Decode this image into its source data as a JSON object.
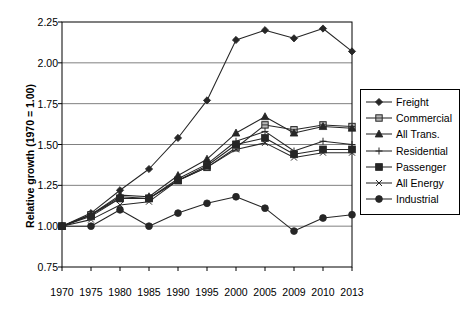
{
  "chart_data": {
    "type": "line",
    "title": "",
    "xlabel": "",
    "ylabel": "Relative growth (1970 = 1.00)",
    "categories": [
      "1970",
      "1975",
      "1980",
      "1985",
      "1990",
      "1995",
      "2000",
      "2005",
      "2009",
      "2010",
      "2013"
    ],
    "x": [
      1970,
      1975,
      1980,
      1985,
      1990,
      1995,
      2000,
      2005,
      2009,
      2010,
      2013
    ],
    "ylim": [
      0.75,
      2.25
    ],
    "yticks": [
      "0.75",
      "1.00",
      "1.25",
      "1.50",
      "1.75",
      "2.00",
      "2.25"
    ],
    "ytick_values": [
      0.75,
      1.0,
      1.25,
      1.5,
      1.75,
      2.0,
      2.25
    ],
    "grid": true,
    "legend_position": "right",
    "series": [
      {
        "name": "Freight",
        "marker": "diamond",
        "values": [
          1.0,
          1.08,
          1.22,
          1.35,
          1.54,
          1.77,
          2.14,
          2.2,
          2.15,
          2.21,
          2.07
        ]
      },
      {
        "name": "Commercial",
        "marker": "square-hatched",
        "values": [
          1.0,
          1.07,
          1.17,
          1.17,
          1.28,
          1.36,
          1.48,
          1.62,
          1.59,
          1.62,
          1.61
        ]
      },
      {
        "name": "All Trans.",
        "marker": "triangle",
        "values": [
          1.0,
          1.07,
          1.19,
          1.18,
          1.31,
          1.41,
          1.57,
          1.67,
          1.57,
          1.61,
          1.6
        ]
      },
      {
        "name": "Residential",
        "marker": "plus",
        "values": [
          1.0,
          1.07,
          1.18,
          1.17,
          1.29,
          1.38,
          1.52,
          1.58,
          1.46,
          1.52,
          1.5
        ]
      },
      {
        "name": "Passenger",
        "marker": "filled-square",
        "values": [
          1.0,
          1.06,
          1.17,
          1.17,
          1.28,
          1.37,
          1.5,
          1.54,
          1.44,
          1.47,
          1.47
        ]
      },
      {
        "name": "All Energy",
        "marker": "x",
        "values": [
          1.0,
          1.04,
          1.13,
          1.15,
          1.28,
          1.36,
          1.47,
          1.51,
          1.42,
          1.45,
          1.45
        ]
      },
      {
        "name": "Industrial",
        "marker": "filled-circle",
        "values": [
          1.0,
          1.0,
          1.1,
          1.0,
          1.08,
          1.14,
          1.18,
          1.11,
          0.97,
          1.05,
          1.07
        ]
      }
    ],
    "legend_entries": [
      "Freight",
      "Commercial",
      "All Trans.",
      "Residential",
      "Passenger",
      "All Energy",
      "Industrial"
    ],
    "colors": {
      "line": "#262626",
      "grid": "#808080",
      "axis": "#000000",
      "background": "#ffffff"
    }
  }
}
